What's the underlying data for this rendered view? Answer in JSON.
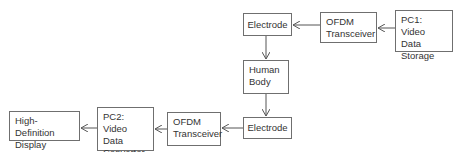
{
  "diagram": {
    "nodes": [
      {
        "id": "electrode-tx",
        "label": "Electrode"
      },
      {
        "id": "ofdm-tx",
        "label": "OFDM\nTransceiver"
      },
      {
        "id": "pc1",
        "label": "PC1:\nVideo Data\nStorage"
      },
      {
        "id": "human-body",
        "label": "Human\nBody"
      },
      {
        "id": "electrode-rx",
        "label": "Electrode"
      },
      {
        "id": "ofdm-rx",
        "label": "OFDM\nTransceiver"
      },
      {
        "id": "pc2",
        "label": "PC2:\nVideo Data\nConvertor"
      },
      {
        "id": "hd-display",
        "label": "High-Definition\nDisplay"
      }
    ],
    "edges": [
      {
        "from": "pc1",
        "to": "ofdm-tx"
      },
      {
        "from": "ofdm-tx",
        "to": "electrode-tx"
      },
      {
        "from": "electrode-tx",
        "to": "human-body"
      },
      {
        "from": "human-body",
        "to": "electrode-rx"
      },
      {
        "from": "electrode-rx",
        "to": "ofdm-rx"
      },
      {
        "from": "ofdm-rx",
        "to": "pc2"
      },
      {
        "from": "pc2",
        "to": "hd-display"
      }
    ]
  }
}
